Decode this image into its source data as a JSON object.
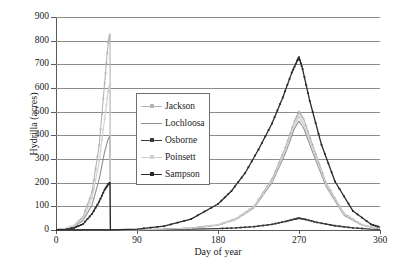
{
  "chart_data": {
    "type": "line",
    "title": "",
    "xlabel": "Day of year",
    "ylabel": "Hydrilla (acres)",
    "xlim": [
      0,
      360
    ],
    "ylim": [
      0,
      900
    ],
    "xticks": [
      0,
      90,
      180,
      270,
      360
    ],
    "yticks": [
      0,
      100,
      200,
      300,
      400,
      500,
      600,
      700,
      800,
      900
    ],
    "grid": "horizontal",
    "legend_position": "upper-center-left",
    "series": [
      {
        "name": "Jackson",
        "color": "#b4b4b4",
        "marker": "plus",
        "x": [
          0,
          10,
          20,
          30,
          40,
          48,
          54,
          58,
          60,
          60.5,
          70,
          90,
          120,
          150,
          180,
          200,
          220,
          240,
          255,
          265,
          270,
          275,
          285,
          300,
          320,
          340,
          360
        ],
        "y": [
          2,
          6,
          18,
          55,
          160,
          360,
          620,
          790,
          830,
          0,
          0,
          1,
          3,
          8,
          22,
          48,
          100,
          215,
          350,
          460,
          500,
          470,
          360,
          200,
          70,
          22,
          6
        ]
      },
      {
        "name": "Lochloosa",
        "color": "#8f8f8f",
        "marker": "none",
        "x": [
          0,
          10,
          20,
          30,
          40,
          48,
          54,
          58,
          60,
          60.5,
          70,
          90,
          120,
          150,
          180,
          200,
          220,
          240,
          255,
          265,
          270,
          275,
          285,
          300,
          320,
          340,
          360
        ],
        "y": [
          2,
          5,
          14,
          40,
          105,
          215,
          330,
          385,
          400,
          0,
          0,
          1,
          3,
          8,
          20,
          44,
          94,
          200,
          325,
          430,
          460,
          432,
          330,
          185,
          62,
          20,
          5
        ]
      },
      {
        "name": "Osborne",
        "color": "#3a3a3a",
        "marker": "plus",
        "x": [
          0,
          20,
          60,
          90,
          120,
          150,
          180,
          200,
          220,
          240,
          255,
          265,
          270,
          278,
          290,
          310,
          330,
          350,
          360
        ],
        "y": [
          1,
          1,
          2,
          2,
          3,
          4,
          6,
          9,
          14,
          24,
          36,
          46,
          50,
          44,
          32,
          18,
          9,
          4,
          3
        ]
      },
      {
        "name": "Poinsett",
        "color": "#cfcfcf",
        "marker": "plus",
        "x": [
          0,
          10,
          20,
          30,
          40,
          48,
          54,
          58,
          60,
          60.5,
          70,
          90,
          120,
          150,
          180,
          200,
          220,
          240,
          255,
          265,
          270,
          275,
          285,
          300,
          320,
          340,
          360
        ],
        "y": [
          2,
          6,
          17,
          48,
          135,
          290,
          470,
          585,
          620,
          0,
          0,
          1,
          3,
          8,
          21,
          46,
          97,
          207,
          338,
          445,
          480,
          450,
          345,
          193,
          66,
          21,
          5
        ]
      },
      {
        "name": "Sampson",
        "color": "#2b2b2b",
        "marker": "star",
        "x": [
          0,
          10,
          20,
          30,
          40,
          48,
          54,
          58,
          60,
          60.5,
          70,
          90,
          120,
          150,
          180,
          195,
          210,
          225,
          240,
          252,
          262,
          268,
          270,
          274,
          282,
          295,
          310,
          330,
          350,
          360
        ],
        "y": [
          1,
          3,
          9,
          25,
          68,
          120,
          170,
          193,
          200,
          0,
          1,
          4,
          16,
          46,
          110,
          165,
          240,
          340,
          450,
          560,
          665,
          715,
          730,
          680,
          545,
          360,
          205,
          80,
          24,
          12
        ]
      }
    ]
  },
  "legend": {
    "items": [
      {
        "label": "Jackson"
      },
      {
        "label": "Lochloosa"
      },
      {
        "label": "Osborne"
      },
      {
        "label": "Poinsett"
      },
      {
        "label": "Sampson"
      }
    ]
  }
}
